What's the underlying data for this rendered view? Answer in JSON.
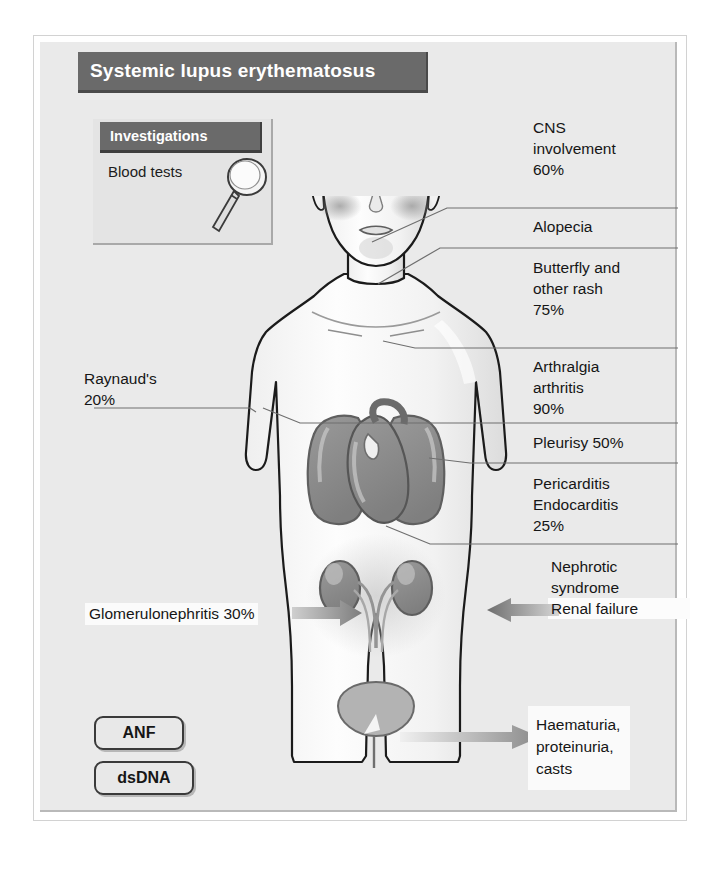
{
  "title": "Systemic lupus erythematosus",
  "investigations": {
    "heading": "Investigations",
    "items": [
      "Blood tests"
    ],
    "icon": "magnifying-glass-icon"
  },
  "antibody_tests": [
    {
      "label": "ANF"
    },
    {
      "label": "dsDNA"
    }
  ],
  "features": {
    "cns": "CNS\ninvolvement\n60%",
    "alopecia": "Alopecia",
    "butterfly": "Butterfly and\nother rash\n75%",
    "arthralgia": "Arthralgia\narthritis\n90%",
    "pleurisy": "Pleurisy 50%",
    "pericarditis": "Pericarditis\nEndocarditis\n25%",
    "nephrotic": "Nephrotic\nsyndrome\nRenal failure",
    "raynaud": "Raynaud's\n20%",
    "glomerulonephritis": "Glomerulonephritis 30%",
    "haematuria": "Haematuria,\nproteinuria,\ncasts"
  },
  "prevalence": {
    "cns_involvement_percent": 60,
    "butterfly_rash_percent": 75,
    "arthralgia_arthritis_percent": 90,
    "pleurisy_percent": 50,
    "pericarditis_endocarditis_percent": 25,
    "glomerulonephritis_percent": 30,
    "raynauds_percent": 20
  },
  "colors": {
    "title_bar": "#6a6a6a",
    "panel_bg": "#eaeaea",
    "organ_grey": "#8c8c8c",
    "body_outline": "#1b1b1b",
    "text": "#161616",
    "leader_line": "#6e6e6e"
  },
  "anatomy_labels": [
    "head",
    "face",
    "butterfly-rash-cheeks",
    "lungs",
    "heart",
    "kidneys",
    "ureters",
    "bladder"
  ]
}
